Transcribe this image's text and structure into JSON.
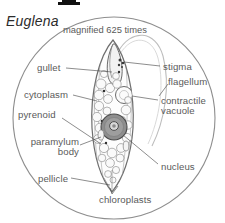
{
  "figure": {
    "title": "Euglena",
    "caption": "magnified 625 times",
    "top_mark": "black-bar-mark"
  },
  "labels": {
    "gullet": "gullet",
    "cytoplasm": "cytoplasm",
    "pyrenoid": "pyrenoid",
    "paramylum_body": "paramylum body",
    "pellicle": "pellicle",
    "stigma": "stigma",
    "flagellum": "flagellum",
    "contractile_vacuole": "contractile vacuole",
    "nucleus": "nucleus",
    "chloroplasts": "chloroplasts"
  },
  "colors": {
    "ink": "#5a5a5a",
    "title_ink": "#2b2b2b",
    "field_circle": "#8a8a8a",
    "cell_outline": "#6e6e6e",
    "nucleus_fill": "#8f8f8f",
    "vacuole_fill": "#fafafa",
    "background": "#ffffff"
  }
}
